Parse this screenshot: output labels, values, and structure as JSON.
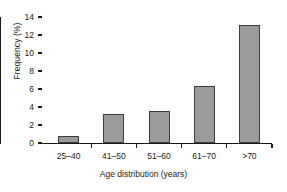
{
  "chart_data": {
    "type": "bar",
    "title": "",
    "xlabel": "Age distribution (years)",
    "ylabel": "Frequency (%)",
    "categories": [
      "25–40",
      "41–50",
      "51–60",
      "61–70",
      ">70"
    ],
    "values": [
      0.8,
      3.2,
      3.6,
      6.3,
      13.1
    ],
    "ylim": [
      0,
      14
    ],
    "yticks": [
      0,
      2,
      4,
      6,
      8,
      10,
      12,
      14
    ],
    "ytick_labels": [
      "0",
      "2",
      "4",
      "6",
      "8",
      "10",
      "12",
      "14"
    ],
    "grid": false,
    "legend": null,
    "series": [
      {
        "name": "Frequency (%)",
        "values": [
          0.8,
          3.2,
          3.6,
          6.3,
          13.1
        ]
      }
    ],
    "colors": {
      "bar_fill": "#9b9b9b",
      "bar_edge": "#3d3d3d",
      "axis": "#1a1a1a",
      "background": "#ffffff"
    }
  }
}
